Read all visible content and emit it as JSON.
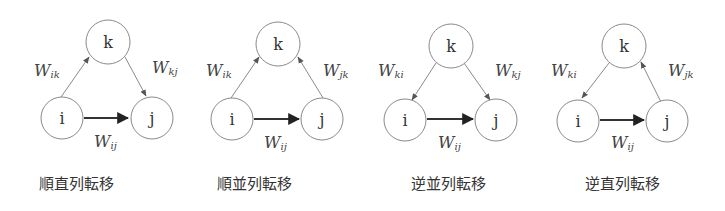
{
  "diagrams": [
    {
      "caption": "順直列転移",
      "nodes": {
        "k": "k",
        "i": "i",
        "j": "j"
      },
      "edges": {
        "left": {
          "label_main": "W",
          "label_sub": "ik",
          "direction": "i-to-k"
        },
        "right": {
          "label_main": "W",
          "label_sub": "kj",
          "direction": "k-to-j"
        },
        "bottom": {
          "label_main": "W",
          "label_sub": "ij",
          "direction": "i-to-j"
        }
      }
    },
    {
      "caption": "順並列転移",
      "nodes": {
        "k": "k",
        "i": "i",
        "j": "j"
      },
      "edges": {
        "left": {
          "label_main": "W",
          "label_sub": "ik",
          "direction": "i-to-k"
        },
        "right": {
          "label_main": "W",
          "label_sub": "jk",
          "direction": "j-to-k"
        },
        "bottom": {
          "label_main": "W",
          "label_sub": "ij",
          "direction": "i-to-j"
        }
      }
    },
    {
      "caption": "逆並列転移",
      "nodes": {
        "k": "k",
        "i": "i",
        "j": "j"
      },
      "edges": {
        "left": {
          "label_main": "W",
          "label_sub": "ki",
          "direction": "k-to-i"
        },
        "right": {
          "label_main": "W",
          "label_sub": "kj",
          "direction": "k-to-j"
        },
        "bottom": {
          "label_main": "W",
          "label_sub": "ij",
          "direction": "i-to-j"
        }
      }
    },
    {
      "caption": "逆直列転移",
      "nodes": {
        "k": "k",
        "i": "i",
        "j": "j"
      },
      "edges": {
        "left": {
          "label_main": "W",
          "label_sub": "ki",
          "direction": "k-to-i"
        },
        "right": {
          "label_main": "W",
          "label_sub": "jk",
          "direction": "j-to-k"
        },
        "bottom": {
          "label_main": "W",
          "label_sub": "ij",
          "direction": "i-to-j"
        }
      }
    }
  ]
}
